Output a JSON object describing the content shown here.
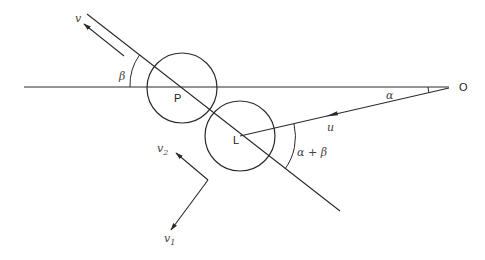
{
  "diagram": {
    "title": "",
    "points": {
      "O": {
        "label": "O",
        "x": 453,
        "y": 87
      },
      "P": {
        "label": "P",
        "x": 182,
        "y": 87
      },
      "L": {
        "label": "L",
        "x": 240,
        "y": 136
      }
    },
    "circles": [
      {
        "name": "circle-P",
        "cx": 182,
        "cy": 87,
        "r": 35
      },
      {
        "name": "circle-L",
        "cx": 240,
        "cy": 136,
        "r": 35
      }
    ],
    "labels": {
      "v": "v",
      "beta": "β",
      "alpha": "α",
      "u": "u",
      "alpha_plus_beta": "α + β",
      "v1": "v",
      "v1_sub": "1",
      "v2": "v",
      "v2_sub": "2",
      "P": "P",
      "L": "L",
      "O": "O"
    },
    "lines": {
      "horizontal": {
        "x1": 24,
        "y1": 87,
        "x2": 450,
        "y2": 87
      },
      "diagonal": {
        "x1": 87,
        "y1": 14,
        "x2": 340,
        "y2": 211
      },
      "u_line": {
        "x1": 240,
        "y1": 136,
        "x2": 450,
        "y2": 87
      }
    },
    "angles": [
      {
        "name": "alpha",
        "vertex": "O",
        "between": [
          "horizontal",
          "u_line"
        ]
      },
      {
        "name": "beta",
        "vertex": "P",
        "between": [
          "horizontal",
          "diagonal"
        ]
      },
      {
        "name": "alpha+beta",
        "vertex": "L",
        "between": [
          "u_line",
          "diagonal"
        ]
      }
    ],
    "vectors": [
      "v",
      "u",
      "v1",
      "v2"
    ],
    "colors": {
      "stroke": "#2a2a2a",
      "text": "#333333",
      "background": "#ffffff"
    }
  }
}
